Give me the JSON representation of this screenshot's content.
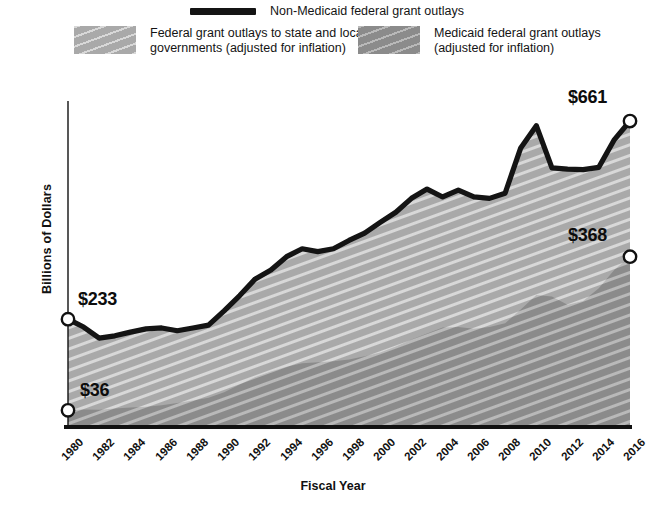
{
  "legend": {
    "line_entry": {
      "label": "Non-Medicaid federal grant outlays",
      "marker": "line-swatch",
      "color": "#141414"
    },
    "area_entries": [
      {
        "label": "Federal grant outlays to state and local\ngovernments (adjusted for inflation)",
        "marker": "area-swatch-light",
        "color": "#a9a9a9"
      },
      {
        "label": "Medicaid federal grant outlays\n(adjusted for inflation)",
        "marker": "area-swatch-dark",
        "color": "#8b8b8b"
      }
    ]
  },
  "annotations": [
    {
      "name": "total-1980",
      "text": "$233",
      "x": 1980,
      "y": 233
    },
    {
      "name": "medicaid-1980",
      "text": "$36",
      "x": 1980,
      "y": 36
    },
    {
      "name": "total-2016",
      "text": "$661",
      "x": 2016,
      "y": 661
    },
    {
      "name": "medicaid-2016",
      "text": "$368",
      "x": 2016,
      "y": 368
    }
  ],
  "chart_data": {
    "type": "area",
    "title": "",
    "xlabel": "Fiscal Year",
    "ylabel": "Billions of Dollars",
    "ylim": [
      0,
      700
    ],
    "yticks": [
      0,
      100,
      200,
      300,
      400,
      500,
      600,
      700
    ],
    "xlim": [
      1980,
      2016
    ],
    "xticks": [
      1980,
      1982,
      1984,
      1986,
      1988,
      1990,
      1992,
      1994,
      1996,
      1998,
      2000,
      2002,
      2004,
      2006,
      2008,
      2010,
      2012,
      2014,
      2016
    ],
    "grid": false,
    "legend_position": "top",
    "stacked": true,
    "x": [
      1980,
      1981,
      1982,
      1983,
      1984,
      1985,
      1986,
      1987,
      1988,
      1989,
      1990,
      1991,
      1992,
      1993,
      1994,
      1995,
      1996,
      1997,
      1998,
      1999,
      2000,
      2001,
      2002,
      2003,
      2004,
      2005,
      2006,
      2007,
      2008,
      2009,
      2010,
      2011,
      2012,
      2013,
      2014,
      2015,
      2016
    ],
    "series": [
      {
        "name": "Medicaid federal grant outlays (adjusted for inflation)",
        "color": "#8b8b8b",
        "values": [
          36,
          38,
          37,
          40,
          42,
          44,
          47,
          52,
          57,
          63,
          75,
          92,
          108,
          120,
          130,
          138,
          140,
          142,
          146,
          153,
          161,
          174,
          189,
          202,
          215,
          216,
          212,
          216,
          224,
          254,
          285,
          282,
          264,
          272,
          300,
          340,
          368
        ]
      },
      {
        "name": "Non-Medicaid federal grant outlays (adjusted for inflation)",
        "color": "#a9a9a9",
        "values": [
          197,
          178,
          155,
          157,
          163,
          168,
          167,
          156,
          157,
          157,
          176,
          192,
          212,
          219,
          238,
          247,
          239,
          243,
          257,
          266,
          281,
          290,
          305,
          312,
          282,
          296,
          285,
          278,
          281,
          349,
          366,
          278,
          293,
          284,
          261,
          281,
          293
        ]
      }
    ],
    "total_line": {
      "name": "Total federal grant outlays to state and local governments (adjusted for inflation)",
      "color": "#141414",
      "values": [
        233,
        216,
        192,
        197,
        205,
        212,
        214,
        208,
        214,
        220,
        251,
        284,
        320,
        339,
        368,
        385,
        379,
        385,
        403,
        419,
        442,
        464,
        494,
        514,
        497,
        512,
        497,
        494,
        505,
        603,
        651,
        560,
        557,
        556,
        561,
        621,
        661
      ]
    }
  }
}
